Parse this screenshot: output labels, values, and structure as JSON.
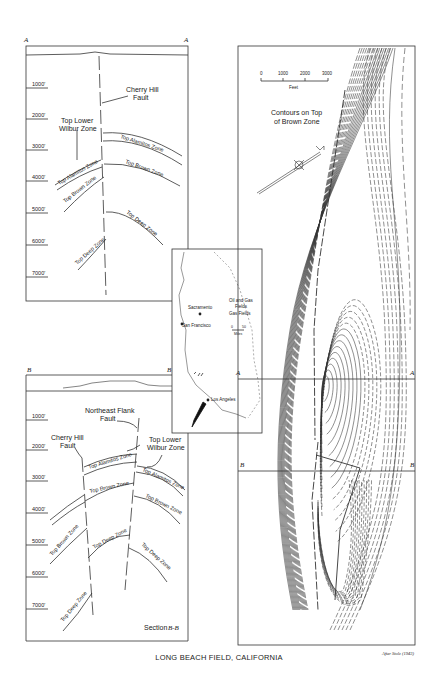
{
  "figure": {
    "title": "LONG BEACH FIELD, CALIFORNIA",
    "credit": "After Stolz (1943)"
  },
  "section_a": {
    "end_left": "A",
    "end_right": "A",
    "depths": [
      "1000'",
      "2000'",
      "3000'",
      "4000'",
      "5000'",
      "6000'",
      "7000'"
    ],
    "fault_label_1": "Cherry Hill",
    "fault_label_2": "Fault",
    "wilbur_label_1": "Top Lower",
    "wilbur_label_2": "Wilbur Zone",
    "zones": {
      "alamitos_right": "Top Alamitos Zone",
      "alamitos_left": "Top Alamitos Zone",
      "brown_right": "Top Brown Zone",
      "brown_left": "Top Brown Zone",
      "deep_right": "Top Deep Zone",
      "deep_left": "Top Deep Zone"
    }
  },
  "section_b": {
    "end_left": "B",
    "end_right": "B",
    "depths": [
      "1000'",
      "2000'",
      "3000'",
      "4000'",
      "5000'",
      "6000'",
      "7000'"
    ],
    "ne_fault_label_1": "Northeast Flank",
    "ne_fault_label_2": "Fault",
    "ch_fault_label_1": "Cherry Hill",
    "ch_fault_label_2": "Fault",
    "wilbur_label_1": "Top Lower",
    "wilbur_label_2": "Wilbur Zone",
    "zones": {
      "alamitos_center": "Top Alamitos Zone",
      "alamitos_right": "Top Alamitos Zone",
      "brown_center": "Top Brown Zone",
      "brown_right": "Top Brown Zone",
      "brown_left": "Top Brown Zone",
      "deep_center": "Top Deep Zone",
      "deep_right": "Top Deep Zone",
      "deep_left": "Top Deep Zone"
    },
    "section_label": "Section",
    "section_id": "B-B"
  },
  "inset_map": {
    "cities": [
      "Sacramento",
      "San Francisco",
      "Los Angeles"
    ],
    "legend": {
      "oil_gas_1": "Oil and Gas",
      "oil_gas_2": "Fields",
      "gas": "Gas Fields"
    },
    "scale": {
      "start": "0",
      "end": "50",
      "unit": "Miles"
    }
  },
  "contour_map": {
    "title_1": "Contours on Top",
    "title_2": "of Brown Zone",
    "scale": {
      "ticks": [
        "0",
        "1000",
        "2000",
        "3000"
      ],
      "unit": "Feet"
    },
    "section_lines": [
      {
        "left": "A",
        "right": "A"
      },
      {
        "left": "B",
        "right": "B"
      }
    ]
  }
}
